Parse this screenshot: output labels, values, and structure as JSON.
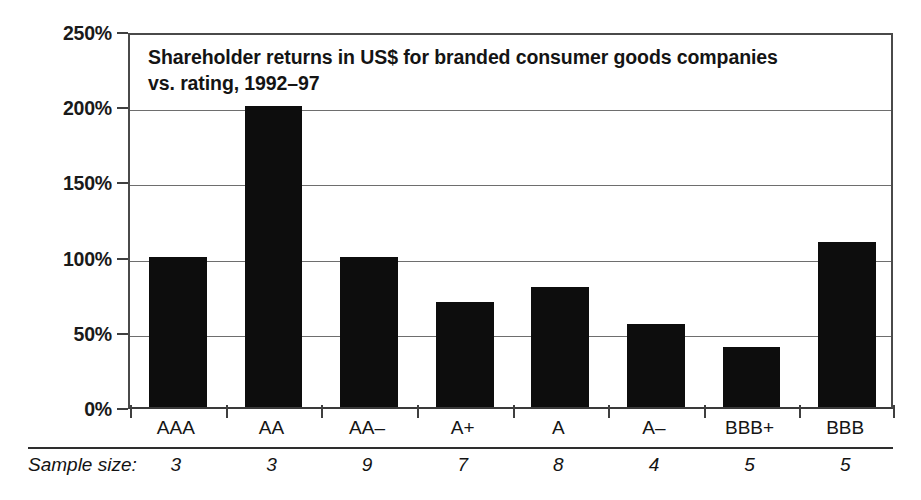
{
  "chart_data": {
    "type": "bar",
    "title_line1": "Shareholder returns in US$ for branded consumer goods companies",
    "title_line2": "vs. rating, 1992–97",
    "xlabel": "",
    "ylabel": "",
    "categories": [
      "AAA",
      "AA",
      "AA–",
      "A+",
      "A",
      "A–",
      "BBB+",
      "BBB"
    ],
    "values": [
      100,
      200,
      100,
      70,
      80,
      55,
      40,
      110
    ],
    "value_unit": "%",
    "ylim": [
      0,
      250
    ],
    "ytick_values": [
      0,
      50,
      100,
      150,
      200,
      250
    ],
    "ytick_labels": [
      "0%",
      "50%",
      "100%",
      "150%",
      "200%",
      "250%"
    ],
    "grid": true,
    "grid_axis": "y",
    "legend": false,
    "bar_color": "#0d0d0d",
    "gridline_color": "#6e6e6e",
    "frame_color": "#4a4a4a",
    "text_color": "#141414",
    "annotations": {
      "sample_size_label": "Sample size:",
      "sample_sizes": [
        3,
        3,
        9,
        7,
        8,
        4,
        5,
        5
      ],
      "sample_size_strings": [
        "3",
        "3",
        "9",
        "7",
        "8",
        "4",
        "5",
        "5"
      ]
    }
  }
}
